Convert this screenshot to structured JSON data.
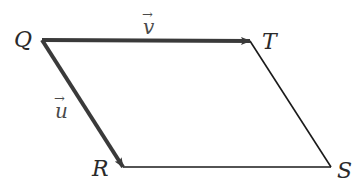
{
  "diagram": {
    "type": "parallelogram",
    "vertices": [
      {
        "name": "Q",
        "x": 41,
        "y": 40
      },
      {
        "name": "T",
        "x": 250,
        "y": 41
      },
      {
        "name": "R",
        "x": 123,
        "y": 167
      },
      {
        "name": "S",
        "x": 331,
        "y": 167
      }
    ],
    "vectors": [
      {
        "name": "v",
        "label": "v",
        "from": "Q",
        "to": "T",
        "arrow": "→"
      },
      {
        "name": "u",
        "label": "u",
        "from": "Q",
        "to": "R",
        "arrow": "→"
      }
    ],
    "labels": {
      "Q": "Q",
      "T": "T",
      "R": "R",
      "S": "S",
      "v": "v",
      "u": "u",
      "arrow": "→"
    },
    "colors": {
      "vector_stroke": "#3a3a3a",
      "edge_stroke": "#1a1a1a",
      "label": "#2a2a2a",
      "background": "#ffffff"
    }
  }
}
